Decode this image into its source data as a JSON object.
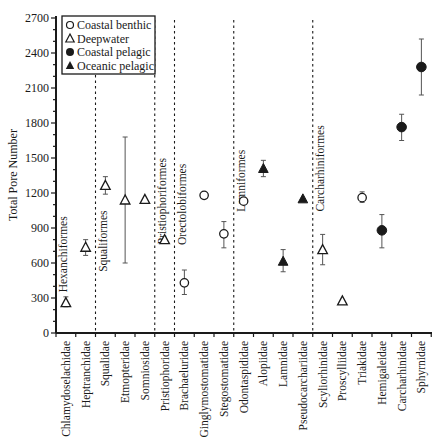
{
  "chart_data": {
    "type": "scatter",
    "title": "",
    "xlabel": "",
    "ylabel": "Total Pore Number",
    "ylim": [
      0,
      2700
    ],
    "yticks": [
      0,
      300,
      600,
      900,
      1200,
      1500,
      1800,
      2100,
      2400,
      2700
    ],
    "grid": false,
    "legend_position": "upper left",
    "legend": [
      {
        "name": "Coastal benthic",
        "marker": "open-circle"
      },
      {
        "name": "Deepwater",
        "marker": "open-triangle"
      },
      {
        "name": "Coastal pelagic",
        "marker": "filled-circle"
      },
      {
        "name": "Oceanic pelagic",
        "marker": "filled-triangle"
      }
    ],
    "categories": [
      "Chlamydoselachidae",
      "Heptranchidae",
      "Squalidae",
      "Etmopteridae",
      "Somniosidae",
      "Pristiophoridae",
      "Brachaeluridae",
      "Ginglymostomatidae",
      "Stegostomatidae",
      "Odontaspididae",
      "Alopiidae",
      "Lamnidae",
      "Pseudocarchariidae",
      "Scyliorhinidae",
      "Proscylliidae",
      "Triakidae",
      "Hemigaleidae",
      "Carcharhinidae",
      "Sphyrnidae"
    ],
    "points": [
      {
        "family": "Chlamydoselachidae",
        "group": "Deepwater",
        "value": 260,
        "err_low": 225,
        "err_high": 310
      },
      {
        "family": "Heptranchidae",
        "group": "Deepwater",
        "value": 735,
        "err_low": 665,
        "err_high": 800
      },
      {
        "family": "Squalidae",
        "group": "Deepwater",
        "value": 1265,
        "err_low": 1190,
        "err_high": 1340
      },
      {
        "family": "Etmopteridae",
        "group": "Deepwater",
        "value": 1140,
        "err_low": 600,
        "err_high": 1680
      },
      {
        "family": "Somniosidae",
        "group": "Deepwater",
        "value": 1145,
        "err_low": null,
        "err_high": null
      },
      {
        "family": "Pristiophoridae",
        "group": "Deepwater",
        "value": 800,
        "err_low": null,
        "err_high": null
      },
      {
        "family": "Brachaeluridae",
        "group": "Coastal benthic",
        "value": 430,
        "err_low": 330,
        "err_high": 540
      },
      {
        "family": "Ginglymostomatidae",
        "group": "Coastal benthic",
        "value": 1180,
        "err_low": null,
        "err_high": null
      },
      {
        "family": "Stegostomatidae",
        "group": "Coastal benthic",
        "value": 850,
        "err_low": 730,
        "err_high": 955
      },
      {
        "family": "Odontaspididae",
        "group": "Coastal benthic",
        "value": 1130,
        "err_low": null,
        "err_high": null
      },
      {
        "family": "Alopiidae",
        "group": "Oceanic pelagic",
        "value": 1410,
        "err_low": 1340,
        "err_high": 1480
      },
      {
        "family": "Lamnidae",
        "group": "Oceanic pelagic",
        "value": 615,
        "err_low": 525,
        "err_high": 715
      },
      {
        "family": "Pseudocarchariidae",
        "group": "Oceanic pelagic",
        "value": 1150,
        "err_low": null,
        "err_high": null
      },
      {
        "family": "Scyliorhinidae",
        "group": "Deepwater",
        "value": 715,
        "err_low": 585,
        "err_high": 845
      },
      {
        "family": "Proscylliidae",
        "group": "Deepwater",
        "value": 275,
        "err_low": null,
        "err_high": null
      },
      {
        "family": "Triakidae",
        "group": "Coastal benthic",
        "value": 1160,
        "err_low": 1120,
        "err_high": 1210
      },
      {
        "family": "Hemigaleidae",
        "group": "Coastal pelagic",
        "value": 880,
        "err_low": 730,
        "err_high": 1015
      },
      {
        "family": "Carcharhinidae",
        "group": "Coastal pelagic",
        "value": 1765,
        "err_low": 1650,
        "err_high": 1875
      },
      {
        "family": "Sphyrnidae",
        "group": "Coastal pelagic",
        "value": 2280,
        "err_low": 2040,
        "err_high": 2520
      }
    ],
    "order_groups": [
      {
        "name": "Hexanchiformes",
        "start": 0,
        "end": 1,
        "label_y": 1000
      },
      {
        "name": "Squaliformes",
        "start": 2,
        "end": 4,
        "label_y": 1050
      },
      {
        "name": "Pristiophoriformes",
        "start": 5,
        "end": 5,
        "label_y": 1500
      },
      {
        "name": "Orectolobiformes",
        "start": 6,
        "end": 8,
        "label_y": 1450
      },
      {
        "name": "Lamniformes",
        "start": 9,
        "end": 12,
        "label_y": 1570
      },
      {
        "name": "Carcharhiniformes",
        "start": 13,
        "end": 18,
        "label_y": 1780
      }
    ],
    "dividers_after_index": [
      1,
      4,
      5,
      8,
      12
    ]
  },
  "colors": {
    "ink": "#1a1a1a",
    "errorbar": "#555555",
    "background": "#ffffff"
  }
}
